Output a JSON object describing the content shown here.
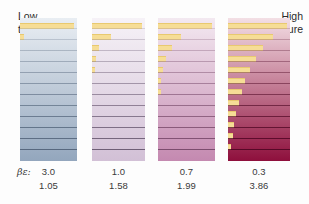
{
  "figure": {
    "background": "#fdfdfd",
    "population_bar_color": "#f6dd96",
    "population_bar_edge": "#e8c96f"
  },
  "labels": {
    "low_temperature": "Low\ntemperature",
    "low_temperature_line1": "Low",
    "low_temperature_line2": "temperature",
    "high_temperature_line1": "High",
    "high_temperature_line2": "temperature",
    "parameter_symbol": "βε:"
  },
  "chart_data": {
    "type": "bar",
    "xlabel": "Population (relative)",
    "ylabel": "Energy level",
    "annotations": [
      "Low temperature",
      "High temperature"
    ],
    "legend": [],
    "grid": true,
    "level_count": 13,
    "row_param_label": "βε:",
    "series": [
      {
        "name": "panel-1",
        "beta_epsilon": "3.0",
        "partition_value": "1.05",
        "x_left_px": 20,
        "width_px": 57,
        "gradient_top": "#e9eef3",
        "gradient_bottom": "#93a6bd",
        "line_color": "#4a5b72",
        "values": [
          0.0,
          0.0,
          0.0,
          0.0,
          0.0,
          0.0,
          0.0,
          0.0,
          0.0,
          0.0,
          0.0,
          0.08,
          1.0
        ]
      },
      {
        "name": "panel-2",
        "beta_epsilon": "1.0",
        "partition_value": "1.58",
        "x_left_px": 92,
        "width_px": 53,
        "gradient_top": "#f6f2f7",
        "gradient_bottom": "#d2c0d6",
        "line_color": "#5a4a63",
        "values": [
          0.0,
          0.0,
          0.0,
          0.0,
          0.0,
          0.0,
          0.0,
          0.0,
          0.03,
          0.07,
          0.14,
          0.38,
          1.0
        ]
      },
      {
        "name": "panel-3",
        "beta_epsilon": "0.7",
        "partition_value": "1.99",
        "x_left_px": 158,
        "width_px": 57,
        "gradient_top": "#f3e9f1",
        "gradient_bottom": "#c489b0",
        "line_color": "#6d3f60",
        "values": [
          0.0,
          0.0,
          0.0,
          0.0,
          0.0,
          0.0,
          0.02,
          0.05,
          0.09,
          0.15,
          0.25,
          0.43,
          1.0
        ]
      },
      {
        "name": "panel-4",
        "beta_epsilon": "0.3",
        "partition_value": "3.86",
        "x_left_px": 228,
        "width_px": 62,
        "gradient_top": "#f3dfe5",
        "gradient_bottom": "#8e0f3c",
        "line_color": "#4a0320",
        "values": [
          0.0,
          0.05,
          0.08,
          0.11,
          0.14,
          0.18,
          0.23,
          0.29,
          0.37,
          0.47,
          0.6,
          0.76,
          1.0
        ]
      }
    ]
  }
}
